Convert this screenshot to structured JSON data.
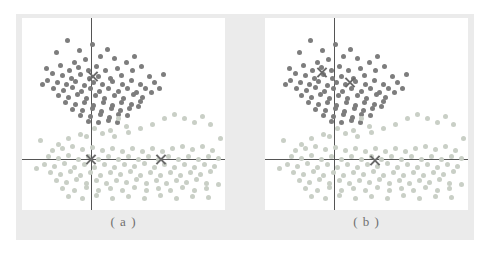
{
  "figure": {
    "background": "#ebebeb",
    "panel_background": "#ffffff",
    "axis_color": "#555555",
    "marker_color": "#6a6a6a"
  },
  "captions": {
    "a": "( a )",
    "b": "( b )"
  },
  "chart_data": {
    "type": "scatter",
    "title": "",
    "xlabel": "",
    "ylabel": "",
    "grid": false,
    "legend": "none",
    "xlim": [
      0,
      203
    ],
    "ylim": [
      0,
      192
    ],
    "axis_origin": {
      "x": 69,
      "y": 141
    },
    "cluster_colors": {
      "dark": "#7d7d7d",
      "light": "#c9cfc6"
    },
    "panels": [
      {
        "label": "( a )",
        "centroids": [
          {
            "x": 71,
            "y": 58,
            "cluster": "dark"
          },
          {
            "x": 69,
            "y": 141,
            "cluster": "light"
          },
          {
            "x": 139,
            "y": 141,
            "cluster": "light"
          }
        ]
      },
      {
        "label": "( b )",
        "centroids": [
          {
            "x": 57,
            "y": 54,
            "cluster": "dark"
          },
          {
            "x": 85,
            "y": 64,
            "cluster": "dark"
          },
          {
            "x": 110,
            "y": 142,
            "cluster": "light"
          }
        ]
      }
    ],
    "series": [
      {
        "name": "dark cluster",
        "color": "#7d7d7d",
        "points": [
          [
            45,
            22
          ],
          [
            57,
            32
          ],
          [
            70,
            26
          ],
          [
            78,
            38
          ],
          [
            63,
            41
          ],
          [
            52,
            44
          ],
          [
            85,
            31
          ],
          [
            92,
            40
          ],
          [
            38,
            47
          ],
          [
            47,
            52
          ],
          [
            56,
            49
          ],
          [
            66,
            52
          ],
          [
            74,
            48
          ],
          [
            83,
            52
          ],
          [
            95,
            50
          ],
          [
            104,
            44
          ],
          [
            30,
            55
          ],
          [
            40,
            57
          ],
          [
            49,
            60
          ],
          [
            58,
            56
          ],
          [
            67,
            60
          ],
          [
            76,
            58
          ],
          [
            88,
            60
          ],
          [
            99,
            57
          ],
          [
            110,
            52
          ],
          [
            119,
            48
          ],
          [
            25,
            62
          ],
          [
            35,
            64
          ],
          [
            44,
            66
          ],
          [
            53,
            63
          ],
          [
            62,
            67
          ],
          [
            71,
            64
          ],
          [
            80,
            66
          ],
          [
            90,
            63
          ],
          [
            100,
            66
          ],
          [
            109,
            62
          ],
          [
            118,
            66
          ],
          [
            127,
            58
          ],
          [
            31,
            70
          ],
          [
            41,
            72
          ],
          [
            50,
            69
          ],
          [
            59,
            73
          ],
          [
            68,
            70
          ],
          [
            77,
            73
          ],
          [
            86,
            70
          ],
          [
            96,
            73
          ],
          [
            105,
            70
          ],
          [
            114,
            74
          ],
          [
            123,
            70
          ],
          [
            132,
            64
          ],
          [
            36,
            77
          ],
          [
            46,
            79
          ],
          [
            55,
            76
          ],
          [
            64,
            80
          ],
          [
            73,
            77
          ],
          [
            82,
            80
          ],
          [
            92,
            77
          ],
          [
            101,
            80
          ],
          [
            111,
            76
          ],
          [
            120,
            79
          ],
          [
            129,
            74
          ],
          [
            43,
            84
          ],
          [
            53,
            86
          ],
          [
            62,
            84
          ],
          [
            71,
            87
          ],
          [
            81,
            84
          ],
          [
            90,
            87
          ],
          [
            99,
            84
          ],
          [
            109,
            86
          ],
          [
            118,
            83
          ],
          [
            50,
            91
          ],
          [
            60,
            92
          ],
          [
            70,
            90
          ],
          [
            79,
            93
          ],
          [
            89,
            90
          ],
          [
            98,
            92
          ],
          [
            107,
            90
          ],
          [
            116,
            88
          ],
          [
            58,
            97
          ],
          [
            68,
            98
          ],
          [
            78,
            96
          ],
          [
            87,
            99
          ],
          [
            96,
            96
          ],
          [
            105,
            97
          ],
          [
            66,
            103
          ],
          [
            76,
            104
          ],
          [
            86,
            102
          ],
          [
            95,
            104
          ],
          [
            24,
            50
          ],
          [
            20,
            66
          ],
          [
            137,
            70
          ],
          [
            141,
            56
          ],
          [
            112,
            38
          ],
          [
            34,
            34
          ]
        ]
      },
      {
        "name": "light cluster",
        "color": "#c9cfc6",
        "points": [
          [
            96,
            100
          ],
          [
            104,
            108
          ],
          [
            88,
            112
          ],
          [
            72,
            110
          ],
          [
            58,
            116
          ],
          [
            46,
            120
          ],
          [
            36,
            126
          ],
          [
            64,
            118
          ],
          [
            80,
            115
          ],
          [
            92,
            118
          ],
          [
            106,
            114
          ],
          [
            118,
            110
          ],
          [
            130,
            106
          ],
          [
            142,
            100
          ],
          [
            152,
            96
          ],
          [
            162,
            100
          ],
          [
            172,
            104
          ],
          [
            180,
            98
          ],
          [
            188,
            106
          ],
          [
            30,
            132
          ],
          [
            40,
            130
          ],
          [
            50,
            128
          ],
          [
            60,
            131
          ],
          [
            70,
            129
          ],
          [
            80,
            132
          ],
          [
            90,
            130
          ],
          [
            100,
            133
          ],
          [
            110,
            130
          ],
          [
            120,
            133
          ],
          [
            130,
            130
          ],
          [
            140,
            133
          ],
          [
            150,
            130
          ],
          [
            160,
            128
          ],
          [
            170,
            131
          ],
          [
            180,
            128
          ],
          [
            190,
            132
          ],
          [
            26,
            138
          ],
          [
            36,
            140
          ],
          [
            46,
            137
          ],
          [
            56,
            141
          ],
          [
            66,
            138
          ],
          [
            76,
            141
          ],
          [
            86,
            138
          ],
          [
            96,
            141
          ],
          [
            106,
            138
          ],
          [
            116,
            141
          ],
          [
            126,
            138
          ],
          [
            136,
            141
          ],
          [
            146,
            138
          ],
          [
            156,
            141
          ],
          [
            166,
            138
          ],
          [
            176,
            141
          ],
          [
            186,
            138
          ],
          [
            196,
            140
          ],
          [
            22,
            146
          ],
          [
            32,
            148
          ],
          [
            42,
            145
          ],
          [
            52,
            149
          ],
          [
            62,
            146
          ],
          [
            72,
            149
          ],
          [
            82,
            146
          ],
          [
            92,
            149
          ],
          [
            102,
            146
          ],
          [
            112,
            148
          ],
          [
            122,
            145
          ],
          [
            132,
            149
          ],
          [
            142,
            146
          ],
          [
            152,
            149
          ],
          [
            162,
            146
          ],
          [
            172,
            149
          ],
          [
            182,
            146
          ],
          [
            192,
            148
          ],
          [
            28,
            154
          ],
          [
            38,
            156
          ],
          [
            48,
            153
          ],
          [
            58,
            157
          ],
          [
            68,
            154
          ],
          [
            78,
            157
          ],
          [
            88,
            154
          ],
          [
            98,
            156
          ],
          [
            108,
            153
          ],
          [
            118,
            157
          ],
          [
            128,
            154
          ],
          [
            138,
            157
          ],
          [
            148,
            154
          ],
          [
            158,
            157
          ],
          [
            168,
            154
          ],
          [
            178,
            156
          ],
          [
            188,
            153
          ],
          [
            34,
            162
          ],
          [
            44,
            164
          ],
          [
            54,
            161
          ],
          [
            64,
            165
          ],
          [
            74,
            162
          ],
          [
            84,
            165
          ],
          [
            94,
            162
          ],
          [
            104,
            164
          ],
          [
            114,
            161
          ],
          [
            124,
            165
          ],
          [
            134,
            162
          ],
          [
            144,
            165
          ],
          [
            154,
            162
          ],
          [
            164,
            164
          ],
          [
            174,
            161
          ],
          [
            184,
            165
          ],
          [
            40,
            170
          ],
          [
            52,
            172
          ],
          [
            64,
            169
          ],
          [
            76,
            172
          ],
          [
            88,
            170
          ],
          [
            100,
            172
          ],
          [
            112,
            169
          ],
          [
            124,
            172
          ],
          [
            136,
            170
          ],
          [
            148,
            172
          ],
          [
            160,
            169
          ],
          [
            172,
            172
          ],
          [
            184,
            170
          ],
          [
            46,
            178
          ],
          [
            60,
            180
          ],
          [
            74,
            177
          ],
          [
            90,
            180
          ],
          [
            106,
            178
          ],
          [
            122,
            180
          ],
          [
            138,
            177
          ],
          [
            154,
            180
          ],
          [
            170,
            178
          ],
          [
            186,
            179
          ],
          [
            18,
            122
          ],
          [
            14,
            150
          ],
          [
            198,
            120
          ],
          [
            196,
            166
          ]
        ]
      }
    ]
  }
}
